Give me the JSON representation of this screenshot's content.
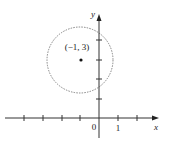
{
  "figure": {
    "type": "coordinate-plane-circle",
    "axes": {
      "x_label": "x",
      "y_label": "y",
      "origin_label": "0",
      "x_tick_label": "1",
      "x_ticks": [
        -5,
        -4,
        -3,
        -2,
        -1,
        1,
        2
      ],
      "y_ticks": [
        1,
        2,
        3,
        4,
        5
      ]
    },
    "circle": {
      "center": [
        -1,
        3
      ],
      "center_label": "(−1, 3)",
      "radius": 1.732,
      "stroke": "#777777",
      "style": "dotted"
    },
    "colors": {
      "axis": "#333333",
      "text": "#222222",
      "point": "#111111"
    }
  }
}
